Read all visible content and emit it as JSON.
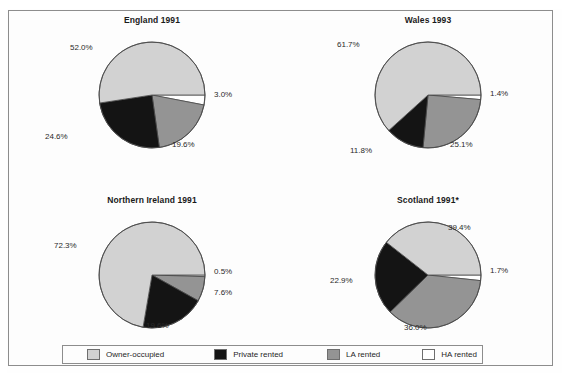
{
  "figure": {
    "background_color": "#fdfdfd",
    "frame_color": "#8d8d8d"
  },
  "palette": {
    "owner_occupied": "#d2d2d2",
    "private_rented": "#141414",
    "la_rented": "#949494",
    "ha_rented": "#ffffff",
    "outline": "#4a4a4a",
    "text": "#2a2a2a"
  },
  "legend": {
    "items": [
      {
        "label": "Owner-occupied",
        "color": "#d2d2d2",
        "swatch_name": "owner-occupied-swatch"
      },
      {
        "label": "Private rented",
        "color": "#141414",
        "swatch_name": "private-rented-swatch"
      },
      {
        "label": "LA rented",
        "color": "#949494",
        "swatch_name": "la-rented-swatch"
      },
      {
        "label": "HA rented",
        "color": "#ffffff",
        "swatch_name": "ha-rented-swatch"
      }
    ]
  },
  "chart_data": [
    {
      "type": "pie",
      "title": "England 1991",
      "labels": [
        "Owner-occupied",
        "Private rented",
        "LA rented",
        "HA rented"
      ],
      "values": [
        52.0,
        24.6,
        19.6,
        3.0
      ],
      "value_labels": [
        "52.0%",
        "24.6%",
        "19.6%",
        "3.0%"
      ],
      "colors": [
        "#d2d2d2",
        "#141414",
        "#949494",
        "#ffffff"
      ],
      "start_angle_deg": 0,
      "direction": "clockwise",
      "legend_position": "bottom"
    },
    {
      "type": "pie",
      "title": "Wales 1993",
      "labels": [
        "Owner-occupied",
        "Private rented",
        "LA rented",
        "HA rented"
      ],
      "values": [
        61.7,
        11.8,
        25.1,
        1.4
      ],
      "value_labels": [
        "61.7%",
        "11.8%",
        "25.1%",
        "1.4%"
      ],
      "colors": [
        "#d2d2d2",
        "#141414",
        "#949494",
        "#ffffff"
      ],
      "start_angle_deg": 0,
      "direction": "clockwise",
      "legend_position": "bottom"
    },
    {
      "type": "pie",
      "title": "Northern Ireland 1991",
      "labels": [
        "Owner-occupied",
        "Private rented",
        "LA rented",
        "HA rented"
      ],
      "values": [
        72.3,
        19.6,
        7.6,
        0.5
      ],
      "value_labels": [
        "72.3%",
        "19.6%",
        "7.6%",
        "0.5%"
      ],
      "colors": [
        "#d2d2d2",
        "#141414",
        "#949494",
        "#ffffff"
      ],
      "start_angle_deg": 0,
      "direction": "clockwise",
      "legend_position": "bottom"
    },
    {
      "type": "pie",
      "title": "Scotland 1991*",
      "labels": [
        "Owner-occupied",
        "Private rented",
        "LA rented",
        "HA rented"
      ],
      "values": [
        39.4,
        22.9,
        36.0,
        1.7
      ],
      "value_labels": [
        "39.4%",
        "22.9%",
        "36.0%",
        "1.7%"
      ],
      "colors": [
        "#d2d2d2",
        "#141414",
        "#949494",
        "#ffffff"
      ],
      "start_angle_deg": 0,
      "direction": "clockwise",
      "legend_position": "bottom"
    }
  ],
  "panels": [
    {
      "name": "england",
      "cx": 152,
      "cy": 95,
      "r": 53,
      "label_pos": [
        {
          "key": "owner",
          "x": 70,
          "y": 43,
          "align": "left"
        },
        {
          "key": "private",
          "x": 45,
          "y": 132,
          "align": "left"
        },
        {
          "key": "la",
          "x": 172,
          "y": 140,
          "align": "left"
        },
        {
          "key": "ha",
          "x": 214,
          "y": 90,
          "align": "left"
        }
      ]
    },
    {
      "name": "wales",
      "cx": 428,
      "cy": 95,
      "r": 53,
      "label_pos": [
        {
          "key": "owner",
          "x": 337,
          "y": 40,
          "align": "left"
        },
        {
          "key": "private",
          "x": 350,
          "y": 146,
          "align": "left"
        },
        {
          "key": "la",
          "x": 450,
          "y": 140,
          "align": "left"
        },
        {
          "key": "ha",
          "x": 490,
          "y": 89,
          "align": "left"
        }
      ]
    },
    {
      "name": "northern-ireland",
      "cx": 152,
      "cy": 275,
      "r": 53,
      "label_pos": [
        {
          "key": "owner",
          "x": 54,
          "y": 241,
          "align": "left"
        },
        {
          "key": "private",
          "x": 146,
          "y": 321,
          "align": "left"
        },
        {
          "key": "la",
          "x": 214,
          "y": 288,
          "align": "left"
        },
        {
          "key": "ha",
          "x": 214,
          "y": 267,
          "align": "left"
        }
      ]
    },
    {
      "name": "scotland",
      "cx": 428,
      "cy": 275,
      "r": 53,
      "label_pos": [
        {
          "key": "owner",
          "x": 448,
          "y": 223,
          "align": "left"
        },
        {
          "key": "private",
          "x": 330,
          "y": 276,
          "align": "left"
        },
        {
          "key": "la",
          "x": 404,
          "y": 323,
          "align": "left"
        },
        {
          "key": "ha",
          "x": 490,
          "y": 266,
          "align": "left"
        }
      ]
    }
  ]
}
